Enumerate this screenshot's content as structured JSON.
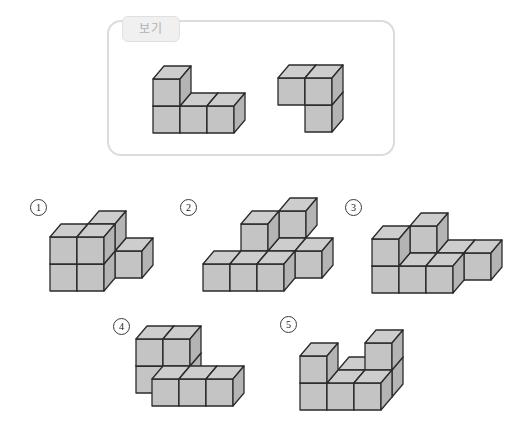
{
  "example_box": {
    "label": "보기"
  },
  "colors": {
    "face_front": "#c4c4c4",
    "face_top": "#cdcdcd",
    "face_right": "#b4b4b4",
    "edge": "#2b2b2b",
    "box_border": "#dcdcdc",
    "tab_bg": "#f0f0f0",
    "tab_text": "#b2b2b2",
    "number_color": "#222222"
  },
  "projection": {
    "cube_size": 27,
    "depth_dx": 11,
    "depth_dy": 13
  },
  "figures": [
    {
      "name": "example-shape-left",
      "origin": [
        153,
        133
      ],
      "cubes": [
        [
          0,
          0,
          0
        ],
        [
          1,
          0,
          0
        ],
        [
          2,
          0,
          0
        ],
        [
          0,
          1,
          0
        ]
      ]
    },
    {
      "name": "example-shape-right",
      "origin": [
        278,
        132
      ],
      "cubes": [
        [
          1,
          0,
          0
        ],
        [
          0,
          1,
          0
        ],
        [
          1,
          1,
          0
        ]
      ]
    },
    {
      "name": "option-figure-1",
      "origin": [
        50,
        291
      ],
      "cubes": [
        [
          0,
          0,
          0
        ],
        [
          1,
          0,
          0
        ],
        [
          0,
          1,
          0
        ],
        [
          1,
          1,
          0
        ],
        [
          1,
          1,
          1
        ],
        [
          2,
          0,
          1
        ]
      ]
    },
    {
      "name": "option-figure-2",
      "origin": [
        203,
        291
      ],
      "cubes": [
        [
          0,
          0,
          0
        ],
        [
          1,
          0,
          0
        ],
        [
          2,
          0,
          0
        ],
        [
          2,
          0,
          1
        ],
        [
          3,
          0,
          1
        ],
        [
          1,
          1,
          1
        ],
        [
          2,
          1,
          2
        ]
      ]
    },
    {
      "name": "option-figure-3",
      "origin": [
        372,
        293
      ],
      "cubes": [
        [
          0,
          0,
          0
        ],
        [
          1,
          0,
          0
        ],
        [
          2,
          0,
          0
        ],
        [
          2,
          0,
          1
        ],
        [
          3,
          0,
          1
        ],
        [
          0,
          1,
          0
        ],
        [
          1,
          1,
          1
        ]
      ]
    },
    {
      "name": "option-figure-4",
      "origin": [
        125,
        406
      ],
      "cubes": [
        [
          0,
          0,
          1
        ],
        [
          1,
          0,
          1
        ],
        [
          0,
          1,
          1
        ],
        [
          1,
          1,
          1
        ],
        [
          1,
          0,
          0
        ],
        [
          2,
          0,
          0
        ],
        [
          3,
          0,
          0
        ]
      ]
    },
    {
      "name": "option-figure-5",
      "origin": [
        300,
        410
      ],
      "cubes": [
        [
          0,
          0,
          0
        ],
        [
          1,
          0,
          0
        ],
        [
          2,
          0,
          0
        ],
        [
          1,
          0,
          1
        ],
        [
          2,
          0,
          1
        ],
        [
          0,
          1,
          0
        ],
        [
          2,
          1,
          1
        ]
      ]
    }
  ],
  "options": [
    {
      "label": "1"
    },
    {
      "label": "2"
    },
    {
      "label": "3"
    },
    {
      "label": "4"
    },
    {
      "label": "5"
    }
  ]
}
